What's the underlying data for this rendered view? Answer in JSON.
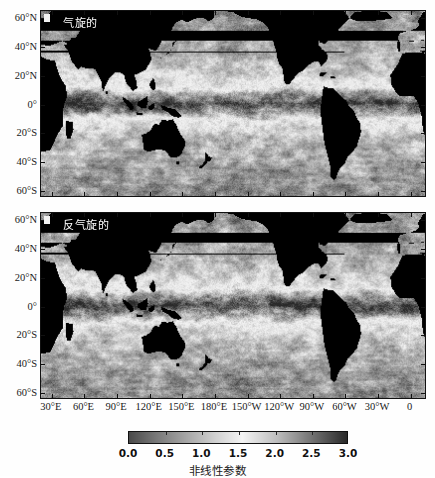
{
  "figure": {
    "type": "two-panel-map-figure",
    "background": "#ffffff"
  },
  "panels": [
    {
      "id": "cyclonic",
      "label": "气旋的",
      "corner_marker": true
    },
    {
      "id": "anticyclonic",
      "label": "反气旋的",
      "corner_marker": true
    }
  ],
  "axes": {
    "y_ticklabels": [
      "60°N",
      "40°N",
      "20°N",
      "0°",
      "20°S",
      "40°S",
      "60°S"
    ],
    "y_tickvalues": [
      60,
      40,
      20,
      0,
      -20,
      -40,
      -60
    ],
    "y_range": [
      -65,
      65
    ],
    "x_ticklabels": [
      "30°E",
      "60°E",
      "90°E",
      "120°E",
      "150°E",
      "180°E",
      "150°W",
      "120°W",
      "90°W",
      "60°W",
      "30°W",
      "0"
    ],
    "x_tickvalues": [
      30,
      60,
      90,
      120,
      150,
      180,
      210,
      240,
      270,
      300,
      330,
      360
    ],
    "x_range": [
      20,
      375
    ]
  },
  "colorbar": {
    "title": "非线性参数",
    "ticklabels": [
      "0.0",
      "0.5",
      "1.0",
      "1.5",
      "2.0",
      "2.5",
      "3.0"
    ],
    "tickvalues": [
      0.0,
      0.5,
      1.0,
      1.5,
      2.0,
      2.5,
      3.0
    ],
    "vmin": 0.0,
    "vmax": 3.0,
    "orientation": "horizontal",
    "colors": [
      "#4a4a4a",
      "#777777",
      "#a5a5a5",
      "#d2d2d2",
      "#f4f4f4",
      "#bdbdbd",
      "#6e6e6e",
      "#2a2a2a"
    ],
    "stops": [
      0.0,
      0.12,
      0.26,
      0.4,
      0.52,
      0.68,
      0.85,
      1.0
    ]
  },
  "chart_data": {
    "type": "heatmap",
    "title": "",
    "xlabel": "",
    "ylabel": "",
    "colorbar_label": "非线性参数",
    "vmin": 0.0,
    "vmax": 3.0,
    "panels": [
      {
        "name": "气旋的",
        "grid_note": "global ocean nonlinearity parameter, cyclonic eddies"
      },
      {
        "name": "反气旋的",
        "grid_note": "global ocean nonlinearity parameter, anticyclonic eddies"
      }
    ],
    "land_color": "#000000",
    "equatorial_band_note": "bright high-value band near equator (0°-10°)",
    "xlim": [
      20,
      375
    ],
    "ylim": [
      -65,
      65
    ],
    "grid": false,
    "legend_position": "bottom"
  }
}
